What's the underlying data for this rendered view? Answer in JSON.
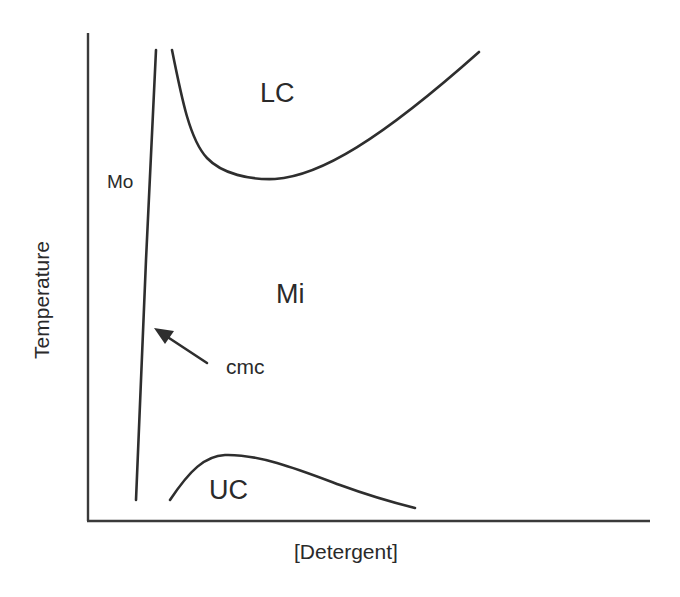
{
  "diagram": {
    "type": "phase-diagram",
    "axes": {
      "xlabel": "[Detergent]",
      "ylabel": "Temperature"
    },
    "regions": {
      "mo": "Mo",
      "lc": "LC",
      "mi": "Mi",
      "uc": "UC"
    },
    "annotation": {
      "cmc": "cmc"
    },
    "colors": {
      "line": "#2e2e2e",
      "background": "#ffffff"
    }
  }
}
